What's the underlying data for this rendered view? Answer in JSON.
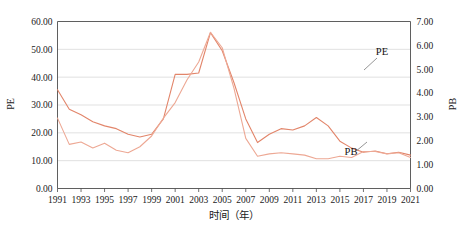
{
  "chart_data": {
    "type": "line",
    "title": "",
    "xlabel": "时间（年）",
    "ylabel": "PE",
    "y2label": "PB",
    "grid": true,
    "legend_position": "inline-annotation",
    "x": [
      1991,
      1992,
      1993,
      1994,
      1995,
      1996,
      1997,
      1998,
      1999,
      2000,
      2001,
      2002,
      2003,
      2004,
      2005,
      2006,
      2007,
      2008,
      2009,
      2010,
      2011,
      2012,
      2013,
      2014,
      2015,
      2016,
      2017,
      2018,
      2019,
      2020,
      2021
    ],
    "xtick_labels": [
      "1991",
      "1993",
      "1995",
      "1997",
      "1999",
      "2001",
      "2003",
      "2005",
      "2007",
      "2009",
      "2011",
      "2013",
      "2015",
      "2017",
      "2019",
      "2021"
    ],
    "xtick_values": [
      1991,
      1993,
      1995,
      1997,
      1999,
      2001,
      2003,
      2005,
      2007,
      2009,
      2011,
      2013,
      2015,
      2017,
      2019,
      2021
    ],
    "xlim": [
      1991,
      2021
    ],
    "ylim": [
      0,
      60
    ],
    "ytick_labels": [
      "0.00",
      "10.00",
      "20.00",
      "30.00",
      "40.00",
      "50.00",
      "60.00"
    ],
    "ytick_values": [
      0,
      10,
      20,
      30,
      40,
      50,
      60
    ],
    "y2lim": [
      0,
      7
    ],
    "y2tick_labels": [
      "0.00",
      "1.00",
      "2.00",
      "3.00",
      "4.00",
      "5.00",
      "6.00",
      "7.00"
    ],
    "y2tick_values": [
      0,
      1,
      2,
      3,
      4,
      5,
      6,
      7
    ],
    "series": [
      {
        "name": "PE",
        "axis": "left",
        "color": "#e2856a",
        "annotation_label": "PE",
        "values": [
          35.5,
          28.5,
          26.5,
          24.0,
          22.5,
          21.5,
          19.5,
          18.5,
          19.5,
          25.0,
          41.0,
          41.0,
          41.5,
          56.0,
          49.5,
          38.0,
          25.0,
          16.5,
          19.5,
          21.5,
          21.0,
          22.5,
          25.5,
          22.5,
          17.0,
          14.5,
          13.0,
          13.5,
          12.5,
          13.0,
          12.0
        ]
      },
      {
        "name": "PB",
        "axis": "right",
        "color": "#eda894",
        "annotation_label": "PB",
        "values": [
          2.95,
          1.85,
          1.95,
          1.7,
          1.9,
          1.6,
          1.5,
          1.75,
          2.2,
          2.95,
          3.6,
          4.55,
          5.3,
          6.55,
          5.9,
          4.2,
          2.1,
          1.35,
          1.45,
          1.5,
          1.45,
          1.4,
          1.25,
          1.25,
          1.35,
          1.3,
          1.55,
          1.55,
          1.45,
          1.5,
          1.3
        ]
      }
    ],
    "annotations": [
      {
        "name": "PE",
        "label": "PE",
        "x_px": 382,
        "y_px": 55
      },
      {
        "name": "PB",
        "label": "PB",
        "x_px": 351,
        "y_px": 155
      }
    ]
  },
  "colors": {
    "pe_line": "#e2856a",
    "pb_line": "#eda894",
    "grid": "#d4d4d4",
    "axis": "#4d4d4d",
    "text": "#1a1a1a",
    "background": "#ffffff"
  }
}
